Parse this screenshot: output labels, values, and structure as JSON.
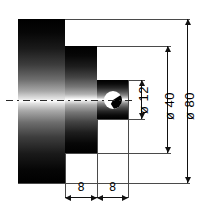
{
  "drawing": {
    "title": "Stepped shaft sectional view",
    "background_color": "#ffffff",
    "line_color": "#4a4a4a",
    "dimension_color": "#111111",
    "body_color_dark": "#000000",
    "body_color_light": "#ffffff"
  },
  "dimensions": {
    "vertical": [
      {
        "id": "bore",
        "label": "ø 12",
        "value": 12,
        "unit": "mm",
        "feature": "centre-bore-diameter"
      },
      {
        "id": "mid_step",
        "label": "ø 40",
        "value": 40,
        "unit": "mm",
        "feature": "middle-step-diameter"
      },
      {
        "id": "outer_body",
        "label": "ø 80",
        "value": 80,
        "unit": "mm",
        "feature": "outer-body-diameter"
      }
    ],
    "horizontal": [
      {
        "id": "len_mid",
        "label": "8",
        "value": 8,
        "unit": "mm",
        "feature": "middle-step-length"
      },
      {
        "id": "len_inner",
        "label": "8",
        "value": 8,
        "unit": "mm",
        "feature": "inner-step-length"
      }
    ]
  },
  "features": {
    "outer_block_name": "outer-cylinder-body",
    "middle_block_name": "middle-step-cylinder",
    "inner_block_name": "inner-step-cylinder",
    "bore_name": "centre-bore",
    "axis_name": "centre-axis-line"
  }
}
